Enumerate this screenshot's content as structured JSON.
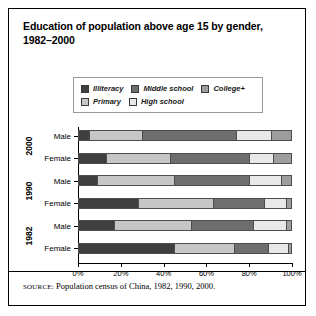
{
  "figure": {
    "title_lines": [
      "Education of population above age 15 by gender,",
      "1982–2000"
    ],
    "source_kicker": "SOURCE:",
    "source_text": " Population census of China, 1982, 1990, 2000."
  },
  "legend": {
    "rows": [
      [
        {
          "label": "Illiteracy",
          "color": "#3f3f3f"
        },
        {
          "label": "Middle school",
          "color": "#6e6e6e"
        },
        {
          "label": "College+",
          "color": "#9d9d9d"
        }
      ],
      [
        {
          "label": "Primary",
          "color": "#c6c6c6"
        },
        {
          "label": "High school",
          "color": "#e8e8e8"
        }
      ]
    ]
  },
  "chart_data": {
    "type": "bar",
    "orientation": "horizontal",
    "stacked": true,
    "percent": true,
    "title": "Education of population above age 15 by gender, 1982–2000",
    "xlabel": "",
    "ylabel": "",
    "xlim": [
      0,
      100
    ],
    "xticks": [
      0,
      20,
      40,
      60,
      80,
      100
    ],
    "xtick_labels": [
      "0%",
      "20%",
      "40%",
      "60%",
      "80%",
      "100%"
    ],
    "grid": false,
    "legend_position": "top",
    "series": [
      {
        "name": "Illiteracy",
        "color": "#3f3f3f",
        "values": [
          5,
          13,
          9,
          28,
          17,
          45
        ]
      },
      {
        "name": "Primary",
        "color": "#c6c6c6",
        "values": [
          25,
          30,
          36,
          35,
          36,
          28
        ]
      },
      {
        "name": "Middle school",
        "color": "#6e6e6e",
        "values": [
          44,
          37,
          35,
          24,
          29,
          16
        ]
      },
      {
        "name": "High school",
        "color": "#e8e8e8",
        "values": [
          16,
          11,
          15,
          10,
          15,
          9
        ]
      },
      {
        "name": "College+",
        "color": "#9d9d9d",
        "values": [
          10,
          9,
          5,
          3,
          3,
          2
        ]
      }
    ],
    "categories": [
      {
        "year": "2000",
        "gender": "Male"
      },
      {
        "year": "2000",
        "gender": "Female"
      },
      {
        "year": "1990",
        "gender": "Male"
      },
      {
        "year": "1990",
        "gender": "Female"
      },
      {
        "year": "1982",
        "gender": "Male"
      },
      {
        "year": "1982",
        "gender": "Female"
      }
    ],
    "year_groups": [
      "2000",
      "1990",
      "1982"
    ]
  }
}
